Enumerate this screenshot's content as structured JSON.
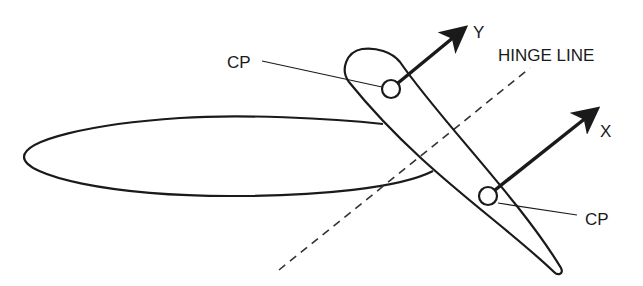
{
  "diagram": {
    "labels": {
      "cp_upper": "CP",
      "cp_lower": "CP",
      "axis_y": "Y",
      "axis_x": "X",
      "hinge_line": "HINGE LINE"
    },
    "colors": {
      "stroke": "#1a1a1a",
      "background": "#ffffff"
    }
  }
}
